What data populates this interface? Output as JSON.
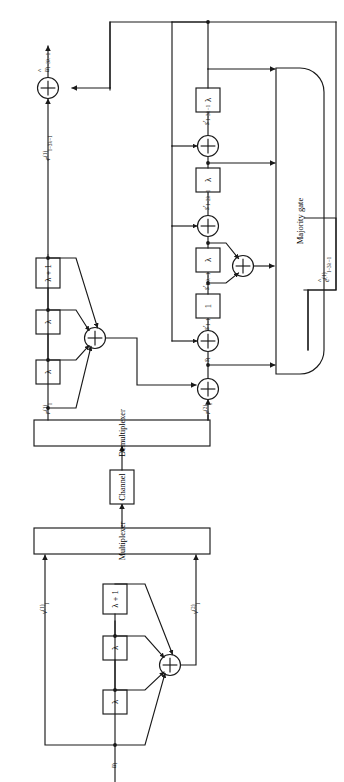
{
  "figure": {
    "orientation": "rotated-90-ccw",
    "line_color": "#1a1a1a",
    "background": "#ffffff"
  },
  "encoder": {
    "input_label": "u_l",
    "input_label_html": "<i>u</i><sub>l</sub>",
    "delay_boxes": [
      {
        "id": "enc-delay-1",
        "label": "λ"
      },
      {
        "id": "enc-delay-2",
        "label": "λ"
      },
      {
        "id": "enc-delay-3",
        "label": "λ + 1"
      }
    ],
    "adder_label": "+",
    "output_v1_label": "v_l^(1)",
    "output_v1_html": "<i>v</i><sup>(1)</sup><sub>l</sub>",
    "output_v2_label": "v_l^(2)",
    "output_v2_html": "<i>v</i><sup>(2)</sup><sub>l</sub>"
  },
  "multiplexer": {
    "label": "Multiplexer"
  },
  "channel": {
    "label": "Channel"
  },
  "demultiplexer": {
    "label": "Demultiplexer"
  },
  "decoder": {
    "r1_label": "r_l^(1)",
    "r1_html": "<i>r</i><sup>(1)</sup><sub>l</sub>",
    "r2_label": "r_l^(2)",
    "r2_html": "<i>r</i><sup>(2)</sup><sub>l</sub>",
    "replica_delay_boxes": [
      {
        "id": "dec-delay-1",
        "label": "λ"
      },
      {
        "id": "dec-delay-2",
        "label": "λ"
      },
      {
        "id": "dec-delay-3",
        "label": "λ + 1"
      }
    ],
    "replica_adder_label": "+",
    "syndrome_adder_label": "+",
    "syndrome_label": "s_l",
    "syndrome_html": "<i>s</i><sub>l</sub>",
    "syndrome_register": [
      {
        "id": "syn-box-1",
        "label": "1",
        "tap_label": "s'_{l-1}",
        "tap_html": "<i>s</i>&prime;<sub>l&minus;1</sub>"
      },
      {
        "id": "syn-box-2",
        "label": "λ",
        "tap_label": "s'_{l-λ-1}",
        "tap_html": "<i>s</i>&prime;<sub>l&minus;λ&minus;1</sub>"
      },
      {
        "id": "syn-box-3",
        "label": "λ",
        "tap_label": "s'_{l-2λ-1}",
        "tap_html": "<i>s</i>&prime;<sub>l&minus;2λ&minus;1</sub>"
      },
      {
        "id": "syn-box-4",
        "label": "λ",
        "tap_label": "s'_{l-3λ-1}",
        "tap_html": "<i>s</i>&prime;<sub>l&minus;3λ&minus;1</sub>"
      }
    ],
    "pair_adder_label": "+",
    "majority_gate": {
      "label": "Majority gate"
    },
    "error_estimate_label": "ê_{l-3λ-1}^(1)",
    "error_estimate_html": "<span class=\"hat\">e</span><sup>(1)</sup><sub>l&minus;3λ&minus;1</sub>",
    "received_delayed_label": "r_{l-3λ-1}^(1)",
    "received_delayed_html": "<i>r</i><sup>(1)</sup><sub>l&minus;3λ&minus;1</sub>",
    "output_adder_label": "+",
    "decoded_output_label": "û_{l-3λ-1}",
    "decoded_output_html": "<span class=\"hat\"><i>u</i></span><sub>l&minus;3λ&minus;1</sub>"
  }
}
